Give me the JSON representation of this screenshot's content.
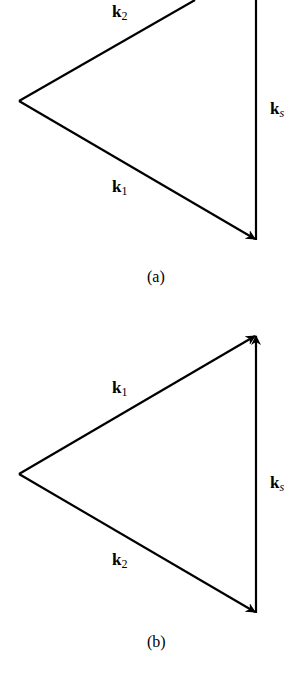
{
  "diagrams": [
    {
      "id": "a",
      "caption": "(a)",
      "vectors": [
        {
          "name": "k2",
          "base": "k",
          "sub": "2",
          "from": [
            19,
            101
          ],
          "to": [
            195,
            0
          ],
          "arrow": false
        },
        {
          "name": "ks",
          "base": "k",
          "sub": "s",
          "from": [
            256,
            0
          ],
          "to": [
            256,
            240
          ],
          "arrow": false
        },
        {
          "name": "k1",
          "base": "k",
          "sub": "1",
          "from": [
            19,
            101
          ],
          "to": [
            256,
            240
          ],
          "arrow": true
        }
      ]
    },
    {
      "id": "b",
      "caption": "(b)",
      "vectors": [
        {
          "name": "k1",
          "base": "k",
          "sub": "1",
          "from": [
            19,
            474
          ],
          "to": [
            256,
            335
          ],
          "arrow": true
        },
        {
          "name": "ks",
          "base": "k",
          "sub": "s",
          "from": [
            256,
            613
          ],
          "to": [
            256,
            335
          ],
          "arrow": true
        },
        {
          "name": "k2",
          "base": "k",
          "sub": "2",
          "from": [
            19,
            474
          ],
          "to": [
            256,
            613
          ],
          "arrow": true
        }
      ]
    }
  ],
  "labels": {
    "a_k2": {
      "base": "k",
      "sub": "2"
    },
    "a_ks": {
      "base": "k",
      "sub": "s"
    },
    "a_k1": {
      "base": "k",
      "sub": "1"
    },
    "b_k1": {
      "base": "k",
      "sub": "1"
    },
    "b_ks": {
      "base": "k",
      "sub": "s"
    },
    "b_k2": {
      "base": "k",
      "sub": "2"
    }
  },
  "colors": {
    "stroke": "#000000",
    "background": "#ffffff"
  }
}
